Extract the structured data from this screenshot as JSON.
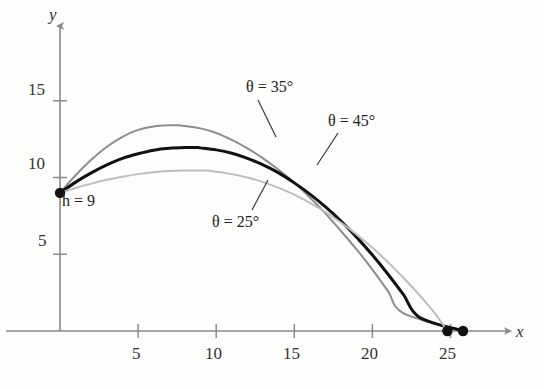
{
  "figure": {
    "background_color": "#fdfdfc",
    "axis_color": "#8a8a8a",
    "x_axis_label": "x",
    "y_axis_label": "y"
  },
  "axes": {
    "x_ticks": [
      {
        "value": 5,
        "label": "5"
      },
      {
        "value": 10,
        "label": "10"
      },
      {
        "value": 15,
        "label": "15"
      },
      {
        "value": 20,
        "label": "20"
      },
      {
        "value": 25,
        "label": "25"
      }
    ],
    "y_ticks": [
      {
        "value": 5,
        "label": "5"
      },
      {
        "value": 10,
        "label": "10"
      },
      {
        "value": 15,
        "label": "15"
      }
    ],
    "xlim": [
      -1.2,
      30.0
    ],
    "ylim": [
      -3.0,
      20.5
    ]
  },
  "annotations": {
    "launch_height": "h = 9",
    "launch_height_value": 9,
    "theta_25": "θ = 25°",
    "theta_35": "θ = 35°",
    "theta_45": "θ = 45°"
  },
  "chart_data": {
    "type": "line",
    "title": "",
    "xlabel": "x",
    "ylabel": "y",
    "xlim": [
      -1.2,
      30.0
    ],
    "ylim": [
      -3.0,
      20.5
    ],
    "grid": false,
    "legend": "inline-annotations",
    "launch_point": {
      "x": 0,
      "y": 9
    },
    "series": [
      {
        "name": "θ = 45°",
        "color": "#8d8d8d",
        "width": 2.0,
        "peak": {
          "x": 7.6,
          "y": 13.4
        },
        "landing": {
          "x": 25.8,
          "y": 0
        },
        "points": [
          {
            "x": 0.0,
            "y": 9.0
          },
          {
            "x": 1.0,
            "y": 10.15
          },
          {
            "x": 2.0,
            "y": 11.15
          },
          {
            "x": 3.0,
            "y": 12.0
          },
          {
            "x": 4.0,
            "y": 12.65
          },
          {
            "x": 5.0,
            "y": 13.1
          },
          {
            "x": 6.0,
            "y": 13.32
          },
          {
            "x": 7.0,
            "y": 13.4
          },
          {
            "x": 7.6,
            "y": 13.4
          },
          {
            "x": 8.0,
            "y": 13.35
          },
          {
            "x": 9.0,
            "y": 13.2
          },
          {
            "x": 10.0,
            "y": 12.9
          },
          {
            "x": 11.0,
            "y": 12.45
          },
          {
            "x": 12.0,
            "y": 11.9
          },
          {
            "x": 13.0,
            "y": 11.25
          },
          {
            "x": 14.0,
            "y": 10.5
          },
          {
            "x": 15.0,
            "y": 9.65
          },
          {
            "x": 16.0,
            "y": 8.7
          },
          {
            "x": 17.0,
            "y": 7.65
          },
          {
            "x": 18.0,
            "y": 6.5
          },
          {
            "x": 19.0,
            "y": 5.3
          },
          {
            "x": 20.0,
            "y": 4.0
          },
          {
            "x": 21.0,
            "y": 2.6
          },
          {
            "x": 22.0,
            "y": 1.15
          },
          {
            "x": 23.0,
            "y": -0.4
          }
        ]
      },
      {
        "name": "θ = 35°",
        "color": "#111111",
        "width": 3.0,
        "peak": {
          "x": 8.8,
          "y": 11.95
        },
        "landing": {
          "x": 25.8,
          "y": 0
        },
        "points": [
          {
            "x": 0.0,
            "y": 9.0
          },
          {
            "x": 1.0,
            "y": 9.7
          },
          {
            "x": 2.0,
            "y": 10.3
          },
          {
            "x": 3.0,
            "y": 10.82
          },
          {
            "x": 4.0,
            "y": 11.25
          },
          {
            "x": 5.0,
            "y": 11.55
          },
          {
            "x": 6.0,
            "y": 11.78
          },
          {
            "x": 7.0,
            "y": 11.9
          },
          {
            "x": 8.0,
            "y": 11.95
          },
          {
            "x": 8.8,
            "y": 11.95
          },
          {
            "x": 9.0,
            "y": 11.93
          },
          {
            "x": 10.0,
            "y": 11.8
          },
          {
            "x": 11.0,
            "y": 11.58
          },
          {
            "x": 12.0,
            "y": 11.25
          },
          {
            "x": 13.0,
            "y": 10.82
          },
          {
            "x": 14.0,
            "y": 10.3
          },
          {
            "x": 15.0,
            "y": 9.65
          },
          {
            "x": 16.0,
            "y": 8.92
          },
          {
            "x": 17.0,
            "y": 8.08
          },
          {
            "x": 18.0,
            "y": 7.15
          },
          {
            "x": 19.0,
            "y": 6.1
          },
          {
            "x": 20.0,
            "y": 4.95
          },
          {
            "x": 21.0,
            "y": 3.7
          },
          {
            "x": 22.0,
            "y": 2.35
          },
          {
            "x": 23.0,
            "y": 0.9
          },
          {
            "x": 24.0,
            "y": -0.65
          },
          {
            "x": 25.8,
            "y": 0.0
          }
        ]
      },
      {
        "name": "θ = 25°",
        "color": "#bdbdbd",
        "width": 2.0,
        "peak": {
          "x": 9.2,
          "y": 10.45
        },
        "landing": {
          "x": 24.8,
          "y": 0
        },
        "points": [
          {
            "x": 0.0,
            "y": 9.0
          },
          {
            "x": 1.0,
            "y": 9.32
          },
          {
            "x": 2.0,
            "y": 9.6
          },
          {
            "x": 3.0,
            "y": 9.85
          },
          {
            "x": 4.0,
            "y": 10.05
          },
          {
            "x": 5.0,
            "y": 10.22
          },
          {
            "x": 6.0,
            "y": 10.35
          },
          {
            "x": 7.0,
            "y": 10.42
          },
          {
            "x": 8.0,
            "y": 10.45
          },
          {
            "x": 9.2,
            "y": 10.45
          },
          {
            "x": 10.0,
            "y": 10.38
          },
          {
            "x": 11.0,
            "y": 10.22
          },
          {
            "x": 12.0,
            "y": 10.0
          },
          {
            "x": 13.0,
            "y": 9.7
          },
          {
            "x": 14.0,
            "y": 9.32
          },
          {
            "x": 15.0,
            "y": 8.88
          },
          {
            "x": 16.0,
            "y": 8.35
          },
          {
            "x": 17.0,
            "y": 7.75
          },
          {
            "x": 18.0,
            "y": 7.05
          },
          {
            "x": 19.0,
            "y": 6.28
          },
          {
            "x": 20.0,
            "y": 5.42
          },
          {
            "x": 21.0,
            "y": 4.48
          },
          {
            "x": 22.0,
            "y": 3.45
          },
          {
            "x": 23.0,
            "y": 2.35
          },
          {
            "x": 24.0,
            "y": 1.15
          },
          {
            "x": 24.8,
            "y": 0.0
          }
        ]
      }
    ],
    "endpoint_markers": [
      {
        "x": 24.8,
        "y": 0,
        "color": "#111111"
      },
      {
        "x": 25.8,
        "y": 0,
        "color": "#111111"
      }
    ]
  }
}
